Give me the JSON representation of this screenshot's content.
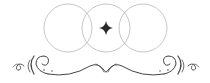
{
  "ornament": {
    "description": "Decorative divider: three overlapping circles with a four-pointed star and a scroll flourish beneath",
    "colors": {
      "background": "#ffffff",
      "circle_stroke": "#b8b8b8",
      "star_fill": "#2a2a2a",
      "flourish_stroke": "#444444"
    },
    "circles": [
      {
        "cx": 68,
        "cy": 28,
        "r": 24
      },
      {
        "cx": 106,
        "cy": 28,
        "r": 24
      },
      {
        "cx": 143,
        "cy": 28,
        "r": 24
      }
    ],
    "star": {
      "cx": 106,
      "cy": 28,
      "size": 7,
      "icon": "four-point-star-icon"
    }
  }
}
